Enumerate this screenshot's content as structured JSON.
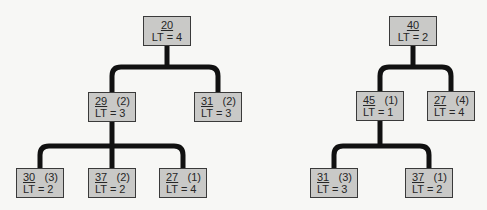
{
  "colors": {
    "node_fill": "#c9c9c7",
    "node_border": "#3a3a3a",
    "connector": "#111111",
    "text": "#262626"
  },
  "trees": [
    {
      "name": "left-tree",
      "nodes": [
        {
          "id": "L-root",
          "value": "20",
          "count": "",
          "lt": "LT = 4",
          "x": 143,
          "y": 16
        },
        {
          "id": "L-a",
          "value": "29",
          "count": "(2)",
          "lt": "LT = 3",
          "x": 88,
          "y": 92
        },
        {
          "id": "L-b",
          "value": "31",
          "count": "(2)",
          "lt": "LT = 3",
          "x": 194,
          "y": 92
        },
        {
          "id": "L-a1",
          "value": "30",
          "count": "(3)",
          "lt": "LT = 2",
          "x": 16,
          "y": 168
        },
        {
          "id": "L-a2",
          "value": "37",
          "count": "(2)",
          "lt": "LT = 2",
          "x": 88,
          "y": 168
        },
        {
          "id": "L-a3",
          "value": "27",
          "count": "(1)",
          "lt": "LT = 4",
          "x": 159,
          "y": 168
        }
      ]
    },
    {
      "name": "right-tree",
      "nodes": [
        {
          "id": "R-root",
          "value": "40",
          "count": "",
          "lt": "LT = 2",
          "x": 389,
          "y": 16
        },
        {
          "id": "R-a",
          "value": "45",
          "count": "(1)",
          "lt": "LT = 1",
          "x": 356,
          "y": 91
        },
        {
          "id": "R-b",
          "value": "27",
          "count": "(4)",
          "lt": "LT = 4",
          "x": 427,
          "y": 91
        },
        {
          "id": "R-a1",
          "value": "31",
          "count": "(3)",
          "lt": "LT = 3",
          "x": 310,
          "y": 168
        },
        {
          "id": "R-a2",
          "value": "37",
          "count": "(1)",
          "lt": "LT = 2",
          "x": 405,
          "y": 168
        }
      ]
    }
  ]
}
